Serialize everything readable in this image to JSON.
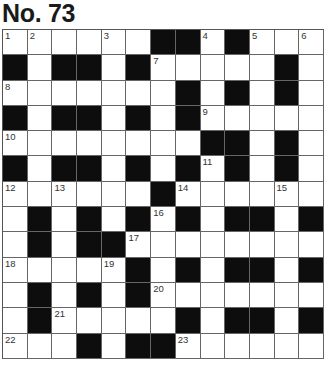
{
  "puzzle": {
    "title": "No. 73",
    "rows": 13,
    "cols": 13,
    "colors": {
      "black": "#0d0d0d",
      "white": "#ffffff",
      "grid_line": "#666666"
    },
    "grid": [
      [
        "1",
        "2",
        "",
        "",
        "3",
        "",
        "#",
        "#",
        "4",
        "#",
        "5",
        "",
        "6"
      ],
      [
        "#",
        "",
        "#",
        "#",
        "",
        "#",
        "7",
        "",
        "",
        "",
        "",
        "#",
        ""
      ],
      [
        "8",
        "",
        "",
        "",
        "",
        "",
        "",
        "#",
        "",
        "#",
        "",
        "#",
        ""
      ],
      [
        "#",
        "",
        "#",
        "#",
        "",
        "#",
        "",
        "#",
        "9",
        "",
        "",
        "",
        ""
      ],
      [
        "10",
        "",
        "",
        "",
        "",
        "",
        "",
        "",
        "#",
        "#",
        "",
        "#",
        ""
      ],
      [
        "#",
        "",
        "#",
        "#",
        "",
        "#",
        "",
        "#",
        "11",
        "#",
        "",
        "#",
        ""
      ],
      [
        "12",
        "",
        "13",
        "",
        "",
        "",
        "#",
        "14",
        "",
        "",
        "",
        "15",
        ""
      ],
      [
        "",
        "#",
        "",
        "#",
        "",
        "#",
        "16",
        "#",
        "",
        "#",
        "#",
        "",
        "#"
      ],
      [
        "",
        "#",
        "",
        "#",
        "#",
        "17",
        "",
        "",
        "",
        "",
        "",
        "",
        ""
      ],
      [
        "18",
        "",
        "",
        "",
        "19",
        "#",
        "",
        "#",
        "",
        "#",
        "#",
        "",
        "#"
      ],
      [
        "",
        "#",
        "",
        "#",
        "",
        "#",
        "20",
        "",
        "",
        "",
        "",
        "",
        ""
      ],
      [
        "",
        "#",
        "21",
        "",
        "",
        "",
        "",
        "#",
        "",
        "#",
        "#",
        "",
        "#"
      ],
      [
        "22",
        "",
        "",
        "#",
        "",
        "#",
        "#",
        "23",
        "",
        "",
        "",
        "",
        ""
      ]
    ]
  }
}
